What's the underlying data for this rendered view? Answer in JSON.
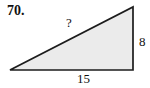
{
  "problem": {
    "number": "70.",
    "figure": {
      "type": "right-triangle",
      "hypotenuse_label": "?",
      "height_label": "8",
      "base_label": "15",
      "fill_color": "#ebebeb",
      "stroke_color": "#1c1c1c",
      "vertices": "10,70 133,70 133,7"
    }
  }
}
